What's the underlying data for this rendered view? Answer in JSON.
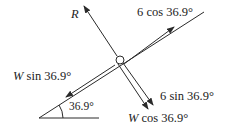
{
  "diagram": {
    "type": "free-body diagram on inclined plane",
    "incline_angle_label": "36.9°",
    "labels": {
      "normal": "R",
      "applied_parallel": "6 cos 36.9°",
      "weight_parallel_var": "W",
      "weight_parallel_rest": " sin 36.9°",
      "applied_perp": "6 sin 36.9°",
      "weight_perp_var": "W",
      "weight_perp_rest": " cos 36.9°",
      "angle": "36.9°"
    },
    "colors": {
      "line": "#2a2a2a",
      "background": "#ffffff"
    }
  }
}
